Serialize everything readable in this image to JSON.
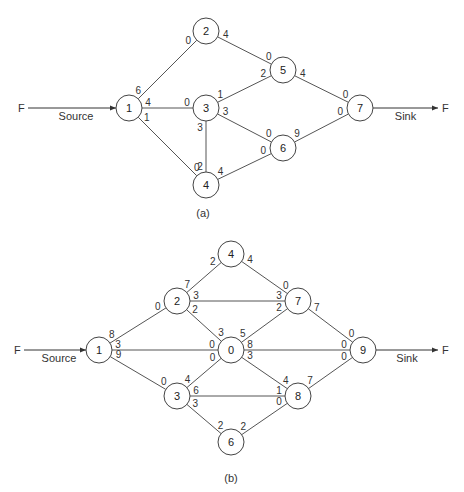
{
  "diagrams": [
    {
      "caption": "(a)",
      "source": {
        "left_label": "F",
        "label": "Source"
      },
      "sink": {
        "label": "Sink",
        "right_label": "F"
      },
      "nodes": [
        {
          "id": "1",
          "x": 129,
          "y": 108
        },
        {
          "id": "2",
          "x": 206,
          "y": 31
        },
        {
          "id": "3",
          "x": 206,
          "y": 108
        },
        {
          "id": "4",
          "x": 206,
          "y": 185
        },
        {
          "id": "5",
          "x": 283,
          "y": 70
        },
        {
          "id": "6",
          "x": 283,
          "y": 148
        },
        {
          "id": "7",
          "x": 360,
          "y": 108
        }
      ],
      "edges": [
        {
          "from": "1",
          "to": "2",
          "from_cap": "6",
          "to_cap": "0"
        },
        {
          "from": "1",
          "to": "3",
          "from_cap": "4",
          "to_cap": "0"
        },
        {
          "from": "1",
          "to": "4",
          "from_cap": "1",
          "to_cap": "0"
        },
        {
          "from": "2",
          "to": "5",
          "from_cap": "4",
          "to_cap": "0"
        },
        {
          "from": "3",
          "to": "5",
          "from_cap": "1",
          "to_cap": "2"
        },
        {
          "from": "3",
          "to": "6",
          "from_cap": "3",
          "to_cap": "0"
        },
        {
          "from": "3",
          "to": "4",
          "from_cap": "3",
          "to_cap": "2"
        },
        {
          "from": "4",
          "to": "6",
          "from_cap": "4",
          "to_cap": "0"
        },
        {
          "from": "5",
          "to": "7",
          "from_cap": "4",
          "to_cap": "0"
        },
        {
          "from": "6",
          "to": "7",
          "from_cap": "9",
          "to_cap": "0"
        }
      ]
    },
    {
      "caption": "(b)",
      "source": {
        "left_label": "F",
        "label": "Source"
      },
      "sink": {
        "label": "Sink",
        "right_label": "F"
      },
      "nodes": [
        {
          "id": "1",
          "x": 99,
          "y": 350
        },
        {
          "id": "2",
          "x": 177,
          "y": 301
        },
        {
          "id": "4",
          "x": 231,
          "y": 254
        },
        {
          "id": "7",
          "x": 298,
          "y": 301
        },
        {
          "id": "0",
          "x": 231,
          "y": 350
        },
        {
          "id": "9",
          "x": 363,
          "y": 350
        },
        {
          "id": "3",
          "x": 177,
          "y": 396
        },
        {
          "id": "8",
          "x": 298,
          "y": 396
        },
        {
          "id": "6",
          "x": 231,
          "y": 442
        }
      ],
      "edges": [
        {
          "from": "1",
          "to": "2",
          "from_cap": "8",
          "to_cap": "0"
        },
        {
          "from": "1",
          "to": "0",
          "from_cap": "3",
          "to_cap": "0"
        },
        {
          "from": "1",
          "to": "3",
          "from_cap": "9",
          "to_cap": "0"
        },
        {
          "from": "2",
          "to": "4",
          "from_cap": "7",
          "to_cap": "2"
        },
        {
          "from": "2",
          "to": "7",
          "from_cap": "3",
          "to_cap": "3"
        },
        {
          "from": "2",
          "to": "0",
          "from_cap": "2",
          "to_cap": "3"
        },
        {
          "from": "4",
          "to": "7",
          "from_cap": "4",
          "to_cap": "0"
        },
        {
          "from": "0",
          "to": "7",
          "from_cap": "5",
          "to_cap": "2"
        },
        {
          "from": "0",
          "to": "9",
          "from_cap": "8",
          "to_cap": "0"
        },
        {
          "from": "0",
          "to": "8",
          "from_cap": "3",
          "to_cap": "4"
        },
        {
          "from": "3",
          "to": "0",
          "from_cap": "4",
          "to_cap": "0"
        },
        {
          "from": "3",
          "to": "8",
          "from_cap": "6",
          "to_cap": "1"
        },
        {
          "from": "3",
          "to": "6",
          "from_cap": "3",
          "to_cap": "2"
        },
        {
          "from": "6",
          "to": "8",
          "from_cap": "2",
          "to_cap": "0"
        },
        {
          "from": "7",
          "to": "9",
          "from_cap": "7",
          "to_cap": "0"
        },
        {
          "from": "8",
          "to": "9",
          "from_cap": "7",
          "to_cap": "0"
        }
      ]
    }
  ]
}
